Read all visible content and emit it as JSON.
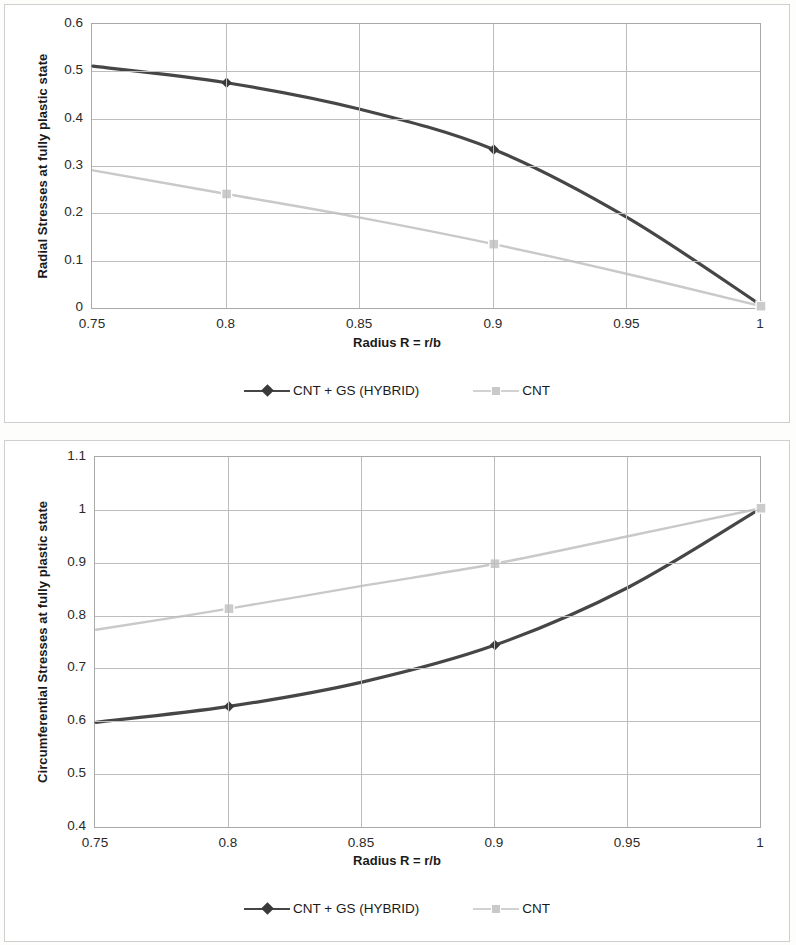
{
  "figure": {
    "background": "#fdfdfc",
    "panel_border": "#cfcfcf"
  },
  "colors": {
    "hybrid": "#464646",
    "cnt": "#c9c9c9",
    "grid": "#bdbdbd",
    "axis": "#a9a9a9",
    "text": "#1a1a1a"
  },
  "legend": {
    "hybrid_label": "CNT + GS (HYBRID)",
    "cnt_label": "CNT",
    "hybrid_marker": "diamond-marker",
    "cnt_marker": "square-marker"
  },
  "chart_data": [
    {
      "id": "radial-stress-chart",
      "type": "line",
      "title": "",
      "xlabel": "Radius R = r/b",
      "ylabel": "Radial Stresses at fully plastic state",
      "xlim": [
        0.75,
        1
      ],
      "ylim": [
        0,
        0.6
      ],
      "xticks": [
        "0.75",
        "0.8",
        "0.85",
        "0.9",
        "0.95",
        "1"
      ],
      "xtick_values": [
        0.75,
        0.8,
        0.85,
        0.9,
        0.95,
        1
      ],
      "yticks": [
        "0",
        "0.1",
        "0.2",
        "0.3",
        "0.4",
        "0.5",
        "0.6"
      ],
      "ytick_values": [
        0,
        0.1,
        0.2,
        0.3,
        0.4,
        0.5,
        0.6
      ],
      "grid": true,
      "legend_position": "bottom",
      "x": [
        0.75,
        0.8,
        0.85,
        0.9,
        0.95,
        1
      ],
      "series": [
        {
          "name": "CNT + GS (HYBRID)",
          "color": "#464646",
          "marker": "diamond",
          "marker_x": [
            0.8,
            0.9,
            1
          ],
          "values": [
            0.513,
            0.478,
            0.422,
            0.337,
            0.193,
            0.008
          ]
        },
        {
          "name": "CNT",
          "color": "#c9c9c9",
          "marker": "square",
          "marker_x": [
            0.8,
            0.9,
            1
          ],
          "values": [
            0.293,
            0.243,
            0.193,
            0.137,
            0.074,
            0.006
          ]
        }
      ]
    },
    {
      "id": "circumferential-stress-chart",
      "type": "line",
      "title": "",
      "xlabel": "Radius R = r/b",
      "ylabel": "Circumferential Stresses at fully plastic state",
      "xlim": [
        0.75,
        1
      ],
      "ylim": [
        0.4,
        1.1
      ],
      "xticks": [
        "0.75",
        "0.8",
        "0.85",
        "0.9",
        "0.95",
        "1"
      ],
      "xtick_values": [
        0.75,
        0.8,
        0.85,
        0.9,
        0.95,
        1
      ],
      "yticks": [
        "0.4",
        "0.5",
        "0.6",
        "0.7",
        "0.8",
        "0.9",
        "1",
        "1.1"
      ],
      "ytick_values": [
        0.4,
        0.5,
        0.6,
        0.7,
        0.8,
        0.9,
        1,
        1.1
      ],
      "grid": true,
      "legend_position": "bottom",
      "x": [
        0.75,
        0.8,
        0.85,
        0.9,
        0.95,
        1
      ],
      "series": [
        {
          "name": "CNT + GS (HYBRID)",
          "color": "#464646",
          "marker": "diamond",
          "marker_x": [
            0.8,
            0.9,
            1
          ],
          "values": [
            0.6,
            0.63,
            0.676,
            0.746,
            0.855,
            1.005
          ]
        },
        {
          "name": "CNT",
          "color": "#c9c9c9",
          "marker": "square",
          "marker_x": [
            0.8,
            0.9,
            1
          ],
          "values": [
            0.775,
            0.815,
            0.858,
            0.9,
            0.952,
            1.005
          ]
        }
      ]
    }
  ]
}
